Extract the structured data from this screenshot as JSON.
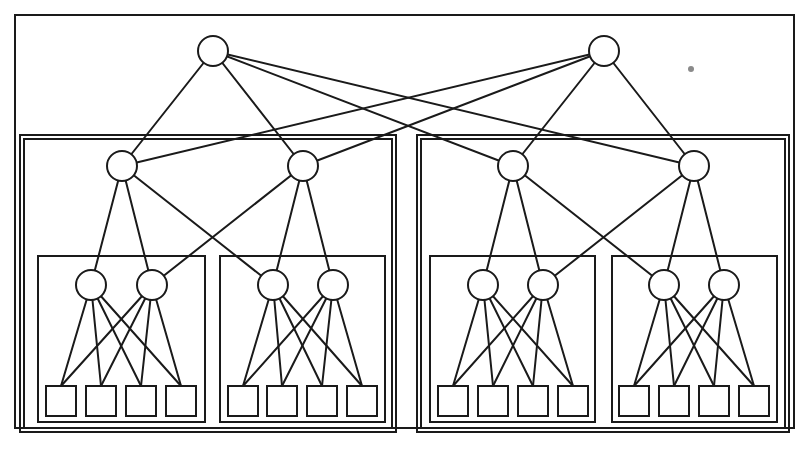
{
  "diagram": {
    "type": "fat-tree network topology",
    "colors": {
      "stroke": "#1a1a1a",
      "background": "#ffffff",
      "speck": "#8a8a8a"
    },
    "boxes": [
      {
        "id": "outer",
        "x": 15,
        "y": 15,
        "w": 779,
        "h": 413
      },
      {
        "id": "group-left",
        "x": 24,
        "y": 139,
        "w": 368,
        "h": 289
      },
      {
        "id": "group-right",
        "x": 421,
        "y": 139,
        "w": 364,
        "h": 289
      },
      {
        "id": "sub-left-1",
        "x": 38,
        "y": 256,
        "w": 167,
        "h": 166
      },
      {
        "id": "sub-left-2",
        "x": 220,
        "y": 256,
        "w": 165,
        "h": 166
      },
      {
        "id": "sub-right-1",
        "x": 430,
        "y": 256,
        "w": 165,
        "h": 166
      },
      {
        "id": "sub-right-2",
        "x": 612,
        "y": 256,
        "w": 165,
        "h": 166
      },
      {
        "id": "frame-left-a",
        "x": 20,
        "y": 135,
        "w": 376,
        "h": 297
      },
      {
        "id": "frame-right-a",
        "x": 417,
        "y": 135,
        "w": 372,
        "h": 297
      }
    ],
    "nodes": {
      "roots": [
        {
          "id": "r0",
          "x": 213,
          "y": 51
        },
        {
          "id": "r1",
          "x": 604,
          "y": 51
        }
      ],
      "mid": [
        {
          "id": "m0",
          "x": 122,
          "y": 166
        },
        {
          "id": "m1",
          "x": 303,
          "y": 166
        },
        {
          "id": "m2",
          "x": 513,
          "y": 166
        },
        {
          "id": "m3",
          "x": 694,
          "y": 166
        }
      ],
      "low": [
        {
          "id": "l0",
          "x": 91,
          "y": 285
        },
        {
          "id": "l1",
          "x": 152,
          "y": 285
        },
        {
          "id": "l2",
          "x": 273,
          "y": 285
        },
        {
          "id": "l3",
          "x": 333,
          "y": 285
        },
        {
          "id": "l4",
          "x": 483,
          "y": 285
        },
        {
          "id": "l5",
          "x": 543,
          "y": 285
        },
        {
          "id": "l6",
          "x": 664,
          "y": 285
        },
        {
          "id": "l7",
          "x": 724,
          "y": 285
        }
      ],
      "leaves": [
        {
          "id": "p0",
          "x": 46,
          "y": 386
        },
        {
          "id": "p1",
          "x": 86,
          "y": 386
        },
        {
          "id": "p2",
          "x": 126,
          "y": 386
        },
        {
          "id": "p3",
          "x": 166,
          "y": 386
        },
        {
          "id": "p4",
          "x": 228,
          "y": 386
        },
        {
          "id": "p5",
          "x": 267,
          "y": 386
        },
        {
          "id": "p6",
          "x": 307,
          "y": 386
        },
        {
          "id": "p7",
          "x": 347,
          "y": 386
        },
        {
          "id": "p8",
          "x": 438,
          "y": 386
        },
        {
          "id": "p9",
          "x": 478,
          "y": 386
        },
        {
          "id": "p10",
          "x": 518,
          "y": 386
        },
        {
          "id": "p11",
          "x": 558,
          "y": 386
        },
        {
          "id": "p12",
          "x": 619,
          "y": 386
        },
        {
          "id": "p13",
          "x": 659,
          "y": 386
        },
        {
          "id": "p14",
          "x": 699,
          "y": 386
        },
        {
          "id": "p15",
          "x": 739,
          "y": 386
        }
      ]
    },
    "node_radius": 15,
    "leaf_size": 30,
    "edges": [
      [
        "r0",
        "m0"
      ],
      [
        "r0",
        "m1"
      ],
      [
        "r0",
        "m2"
      ],
      [
        "r0",
        "m3"
      ],
      [
        "r1",
        "m0"
      ],
      [
        "r1",
        "m1"
      ],
      [
        "r1",
        "m2"
      ],
      [
        "r1",
        "m3"
      ],
      [
        "m0",
        "l0"
      ],
      [
        "m0",
        "l2"
      ],
      [
        "m1",
        "l1"
      ],
      [
        "m1",
        "l3"
      ],
      [
        "m0",
        "l1"
      ],
      [
        "m1",
        "l2"
      ],
      [
        "m2",
        "l4"
      ],
      [
        "m2",
        "l6"
      ],
      [
        "m3",
        "l5"
      ],
      [
        "m3",
        "l7"
      ],
      [
        "m2",
        "l5"
      ],
      [
        "m3",
        "l6"
      ],
      [
        "l0",
        "p0"
      ],
      [
        "l0",
        "p1"
      ],
      [
        "l0",
        "p2"
      ],
      [
        "l0",
        "p3"
      ],
      [
        "l1",
        "p0"
      ],
      [
        "l1",
        "p1"
      ],
      [
        "l1",
        "p2"
      ],
      [
        "l1",
        "p3"
      ],
      [
        "l2",
        "p4"
      ],
      [
        "l2",
        "p5"
      ],
      [
        "l2",
        "p6"
      ],
      [
        "l2",
        "p7"
      ],
      [
        "l3",
        "p4"
      ],
      [
        "l3",
        "p5"
      ],
      [
        "l3",
        "p6"
      ],
      [
        "l3",
        "p7"
      ],
      [
        "l4",
        "p8"
      ],
      [
        "l4",
        "p9"
      ],
      [
        "l4",
        "p10"
      ],
      [
        "l4",
        "p11"
      ],
      [
        "l5",
        "p8"
      ],
      [
        "l5",
        "p9"
      ],
      [
        "l5",
        "p10"
      ],
      [
        "l5",
        "p11"
      ],
      [
        "l6",
        "p12"
      ],
      [
        "l6",
        "p13"
      ],
      [
        "l6",
        "p14"
      ],
      [
        "l6",
        "p15"
      ],
      [
        "l7",
        "p12"
      ],
      [
        "l7",
        "p13"
      ],
      [
        "l7",
        "p14"
      ],
      [
        "l7",
        "p15"
      ]
    ],
    "speck": {
      "x": 691,
      "y": 69,
      "r": 3
    }
  }
}
